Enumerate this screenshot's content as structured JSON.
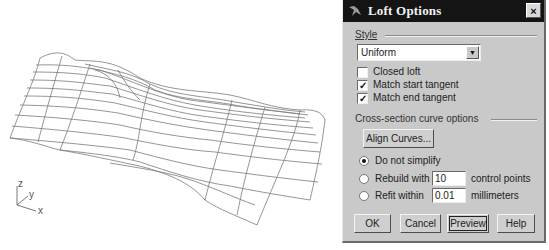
{
  "viewport": {
    "axes": {
      "z": "z",
      "y": "y",
      "x": "x"
    },
    "wire_color": "#7a7a7a"
  },
  "dialog": {
    "title": "Loft Options",
    "close_label": "×",
    "style_group": {
      "label": "Style",
      "selected": "Uniform",
      "dropdown_arrow": "▼"
    },
    "checkboxes": [
      {
        "label": "Closed loft",
        "checked": false,
        "mark": ""
      },
      {
        "label": "Match start tangent",
        "checked": true,
        "mark": "✓"
      },
      {
        "label": "Match end tangent",
        "checked": true,
        "mark": "✓"
      }
    ],
    "cross_section": {
      "label": "Cross-section curve options",
      "align_button": "Align Curves..."
    },
    "radios": [
      {
        "label": "Do not simplify",
        "selected": true
      },
      {
        "label": "Rebuild with",
        "selected": false,
        "value": "10",
        "unit": "control points"
      },
      {
        "label": "Refit within",
        "selected": false,
        "value": "0.01",
        "unit": "millimeters"
      }
    ],
    "buttons": {
      "ok": "OK",
      "cancel": "Cancel",
      "preview": "Preview",
      "help": "Help"
    },
    "colors": {
      "titlebar": "#141414",
      "face": "#c9c9c9"
    }
  }
}
